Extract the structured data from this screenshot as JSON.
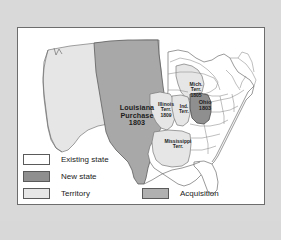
{
  "map": {
    "title": "Louisiana Purchase 1803 map of the United States",
    "labels": {
      "louisiana_purchase": "Louisiana\nPurchase\n1803",
      "michigan_territory": "Mich.\nTerr.\n1805",
      "illinois_territory": "Illinois\nTerr.\n1809",
      "indiana_territory": "Ind.\nTerr.",
      "ohio": "Ohio\n1803",
      "mississippi_territory": "Mississippi\nTerr."
    },
    "colors": {
      "existing_state": "#ffffff",
      "new_state": "#8f8f8f",
      "territory": "#e6e6e6",
      "acquisition": "#b0b0b0",
      "outline": "#6f6f6f",
      "panel_background": "#ffffff",
      "page_background": "#d9d9d9"
    }
  },
  "legend": {
    "items": [
      {
        "label": "Existing state",
        "swatch": "existing-state-swatch"
      },
      {
        "label": "New state",
        "swatch": "new-state-swatch"
      },
      {
        "label": "Territory",
        "swatch": "territory-swatch"
      }
    ],
    "acquisition": {
      "label": "Acquisition",
      "swatch": "acquisition-swatch"
    }
  }
}
